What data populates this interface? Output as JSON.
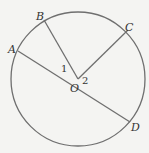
{
  "figure": {
    "type": "circle-geometry",
    "center_label": "O",
    "points": [
      {
        "label": "A"
      },
      {
        "label": "B"
      },
      {
        "label": "C"
      },
      {
        "label": "D"
      }
    ],
    "angle_labels": [
      "1",
      "2"
    ],
    "segments": [
      "AD (diameter through O)",
      "OB",
      "OC"
    ],
    "colors": {
      "stroke": "#6f6f6f",
      "background": "#f4f4f2",
      "text": "#333333"
    }
  }
}
